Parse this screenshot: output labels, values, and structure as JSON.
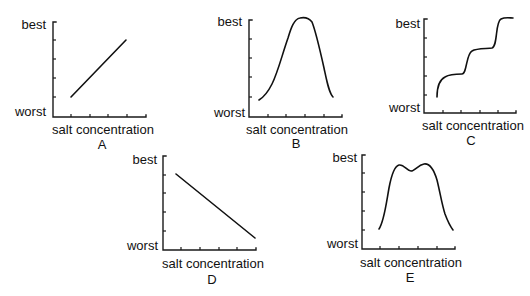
{
  "figure": {
    "y_top_label": "best",
    "y_bottom_label": "worst",
    "x_label": "salt concentration",
    "stroke_color": "#111111",
    "background": "#ffffff"
  },
  "panels": [
    {
      "letter": "A",
      "shape": "increasing straight line",
      "axis": {
        "x0": 53,
        "y_top": 22,
        "y_bottom": 117,
        "x_end": 146
      },
      "y_ticks": [
        40,
        59,
        78,
        97
      ],
      "x_ticks": [
        71,
        90,
        108,
        127
      ],
      "labels": {
        "best": [
          46,
          29
        ],
        "worst": [
          46,
          116
        ],
        "xlabel": [
          103,
          134
        ],
        "letter": [
          102,
          149
        ]
      },
      "curve": "M71,97 L126,40"
    },
    {
      "letter": "B",
      "shape": "single broad peak (bell-shaped)",
      "axis": {
        "x0": 249,
        "y_top": 20,
        "y_bottom": 117,
        "x_end": 342
      },
      "y_ticks": [
        39,
        58,
        77,
        97
      ],
      "x_ticks": [
        268,
        286,
        305,
        324
      ],
      "labels": {
        "best": [
          242,
          26
        ],
        "worst": [
          245,
          117
        ],
        "xlabel": [
          297,
          134
        ],
        "letter": [
          296,
          148
        ]
      },
      "curve": "M259,100 C264,97 268,92 272,84 C278,72 282,55 288,38 C291,28 294,19 300,18 C305,17 309,18 312,22 C316,32 320,50 324,68 C327,82 329,93 333,97"
    },
    {
      "letter": "C",
      "shape": "stepwise increase with three steps",
      "axis": {
        "x0": 424,
        "y_top": 19,
        "y_bottom": 113,
        "x_end": 516
      },
      "y_ticks": [
        38,
        57,
        76,
        95
      ],
      "x_ticks": [
        443,
        461,
        480,
        498
      ],
      "labels": {
        "best": [
          420,
          28
        ],
        "worst": [
          420,
          112
        ],
        "xlabel": [
          473,
          130
        ],
        "letter": [
          471,
          145
        ]
      },
      "curve": "M437,97 C437,88 439,80 445,77 C450,74 458,74 462,74 C467,74 466,54 472,51 C477,48 488,49 492,48 C498,46 495,22 501,19 C505,17 510,18 513,18"
    },
    {
      "letter": "D",
      "shape": "decreasing straight line",
      "axis": {
        "x0": 163,
        "y_top": 156,
        "y_bottom": 250,
        "x_end": 256
      },
      "y_ticks": [
        175,
        193,
        212,
        231
      ],
      "x_ticks": [
        181,
        200,
        219,
        237
      ],
      "labels": {
        "best": [
          157,
          164
        ],
        "worst": [
          158,
          250
        ],
        "xlabel": [
          213,
          268
        ],
        "letter": [
          212,
          284
        ]
      },
      "curve": "M176,174 L255,238"
    },
    {
      "letter": "E",
      "shape": "broad double-humped peak",
      "axis": {
        "x0": 362,
        "y_top": 155,
        "y_bottom": 249,
        "x_end": 455
      },
      "y_ticks": [
        173,
        192,
        211,
        230
      ],
      "x_ticks": [
        380,
        399,
        418,
        437
      ],
      "labels": {
        "best": [
          357,
          162
        ],
        "worst": [
          358,
          248
        ],
        "xlabel": [
          411,
          267
        ],
        "letter": [
          410,
          282
        ]
      },
      "curve": "M379,229 C384,222 386,205 389,188 C392,172 395,166 399,165 C404,164 407,171 411,171 C415,171 418,165 424,164 C430,163 434,170 437,180 C440,192 442,205 445,214 C448,222 450,226 453,230"
    }
  ]
}
